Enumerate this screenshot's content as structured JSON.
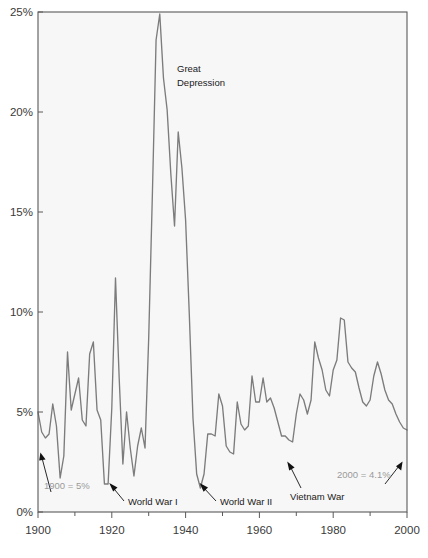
{
  "chart_data": {
    "type": "line",
    "title": "",
    "subtitle": "",
    "xlabel": "",
    "ylabel": "",
    "xlim": [
      1900,
      2000
    ],
    "ylim": [
      0,
      25
    ],
    "grid": false,
    "legend": "none",
    "series_name": "Unemployment rate",
    "x_ticks": [
      1900,
      1920,
      1940,
      1960,
      1980,
      2000
    ],
    "x_tick_labels": [
      "1900",
      "1920",
      "1940",
      "1960",
      "1980",
      "2000"
    ],
    "x_minor_ticks": [
      1910,
      1930,
      1950,
      1970,
      1990
    ],
    "y_ticks": [
      0,
      5,
      10,
      15,
      20,
      25
    ],
    "y_tick_labels": [
      "0%",
      "5%",
      "10%",
      "15%",
      "20%",
      "25%"
    ],
    "x": [
      1900,
      1901,
      1902,
      1903,
      1904,
      1905,
      1906,
      1907,
      1908,
      1909,
      1910,
      1911,
      1912,
      1913,
      1914,
      1915,
      1916,
      1917,
      1918,
      1919,
      1920,
      1921,
      1922,
      1923,
      1924,
      1925,
      1926,
      1927,
      1928,
      1929,
      1930,
      1931,
      1932,
      1933,
      1934,
      1935,
      1936,
      1937,
      1938,
      1939,
      1940,
      1941,
      1942,
      1943,
      1944,
      1945,
      1946,
      1947,
      1948,
      1949,
      1950,
      1951,
      1952,
      1953,
      1954,
      1955,
      1956,
      1957,
      1958,
      1959,
      1960,
      1961,
      1962,
      1963,
      1964,
      1965,
      1966,
      1967,
      1968,
      1969,
      1970,
      1971,
      1972,
      1973,
      1974,
      1975,
      1976,
      1977,
      1978,
      1979,
      1980,
      1981,
      1982,
      1983,
      1984,
      1985,
      1986,
      1987,
      1988,
      1989,
      1990,
      1991,
      1992,
      1993,
      1994,
      1995,
      1996,
      1997,
      1998,
      1999,
      2000
    ],
    "values": [
      5.0,
      4.0,
      3.7,
      3.9,
      5.4,
      4.3,
      1.7,
      2.8,
      8.0,
      5.1,
      5.9,
      6.7,
      4.6,
      4.3,
      7.9,
      8.5,
      5.1,
      4.6,
      1.4,
      1.4,
      5.2,
      11.7,
      6.7,
      2.4,
      5.0,
      3.2,
      1.8,
      3.3,
      4.2,
      3.2,
      8.7,
      15.9,
      23.6,
      24.9,
      21.7,
      20.1,
      16.9,
      14.3,
      19.0,
      17.2,
      14.6,
      9.9,
      4.7,
      1.9,
      1.2,
      1.9,
      3.9,
      3.9,
      3.8,
      5.9,
      5.3,
      3.3,
      3.0,
      2.9,
      5.5,
      4.4,
      4.1,
      4.3,
      6.8,
      5.5,
      5.5,
      6.7,
      5.5,
      5.7,
      5.2,
      4.5,
      3.8,
      3.8,
      3.6,
      3.5,
      4.9,
      5.9,
      5.6,
      4.9,
      5.6,
      8.5,
      7.7,
      7.1,
      6.1,
      5.8,
      7.1,
      7.6,
      9.7,
      9.6,
      7.5,
      7.2,
      7.0,
      6.2,
      5.5,
      5.3,
      5.6,
      6.8,
      7.5,
      6.9,
      6.1,
      5.6,
      5.4,
      4.9,
      4.5,
      4.2,
      4.1
    ]
  },
  "annotations": [
    {
      "id": "great-depression",
      "text_lines": [
        "Great",
        "Depression"
      ],
      "style": "dark",
      "leader": false
    },
    {
      "id": "world-war-i",
      "text_lines": [
        "World War I"
      ],
      "style": "dark",
      "leader": true
    },
    {
      "id": "world-war-ii",
      "text_lines": [
        "World War II"
      ],
      "style": "dark",
      "leader": true
    },
    {
      "id": "vietnam-war",
      "text_lines": [
        "Vietnam War"
      ],
      "style": "dark",
      "leader": true
    },
    {
      "id": "start-value",
      "text_lines": [
        "1900 = 5%"
      ],
      "style": "gray",
      "leader": true
    },
    {
      "id": "end-value",
      "text_lines": [
        "2000 = 4.1%"
      ],
      "style": "gray",
      "leader": true
    }
  ],
  "labels": {
    "great_depression_l1": "Great",
    "great_depression_l2": "Depression",
    "world_war_i": "World War I",
    "world_war_ii": "World War II",
    "vietnam_war": "Vietnam War",
    "start_value": "1900 = 5%",
    "end_value": "2000 = 4.1%"
  },
  "axis": {
    "y0": "0%",
    "y5": "5%",
    "y10": "10%",
    "y15": "15%",
    "y20": "20%",
    "y25": "25%",
    "x1900": "1900",
    "x1920": "1920",
    "x1940": "1940",
    "x1960": "1960",
    "x1980": "1980",
    "x2000": "2000"
  },
  "colors": {
    "line": "#7c7c7c",
    "frame": "#5a5a5a",
    "plot_background": "#f7f7f7",
    "tick_text": "#3a3a3a",
    "annotation_dark": "#1a1a1a",
    "annotation_gray": "#9a9a9a"
  }
}
